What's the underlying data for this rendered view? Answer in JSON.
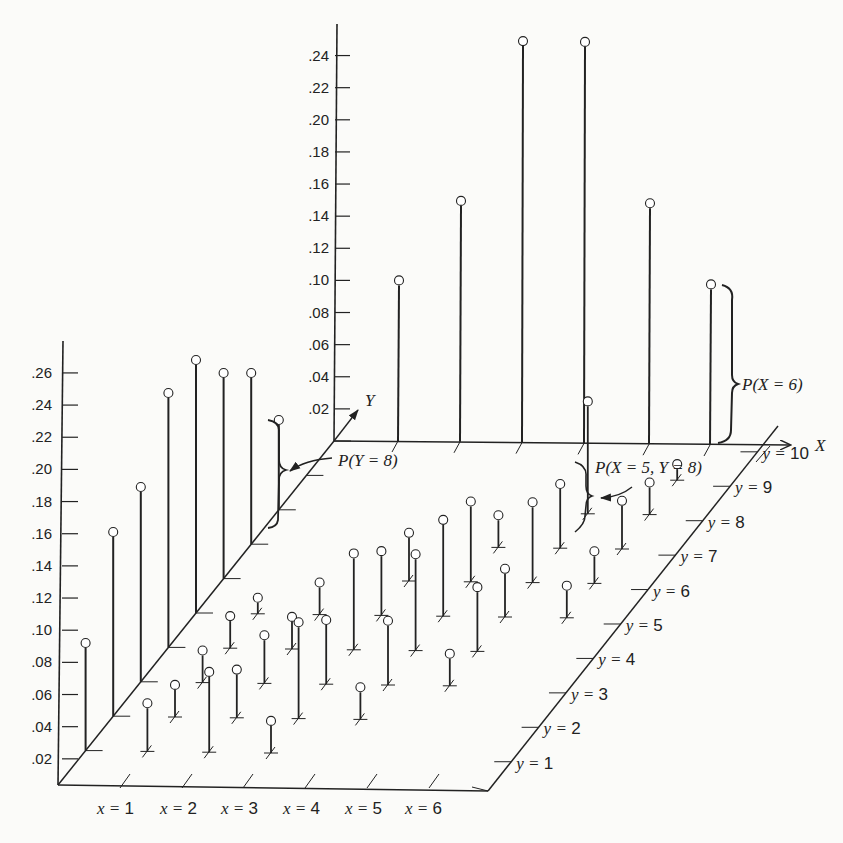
{
  "chart_data": {
    "type": "3d-stem",
    "title": "",
    "x_values": [
      1,
      2,
      3,
      4,
      5,
      6
    ],
    "y_values": [
      1,
      2,
      3,
      4,
      5,
      6,
      7,
      8,
      9,
      10
    ],
    "x_axis_label": "X",
    "y_axis_label": "Y",
    "x_tick_labels": [
      "x = 1",
      "x = 2",
      "x = 3",
      "x = 4",
      "x = 5",
      "x = 6"
    ],
    "y_tick_labels": [
      "y = 1",
      "y = 2",
      "y = 3",
      "y = 4",
      "y = 5",
      "y = 6",
      "y = 7",
      "y = 8",
      "y = 9",
      "y = 10"
    ],
    "marginal_x": {
      "axis_ticks": [
        ".02",
        ".04",
        ".06",
        ".08",
        ".10",
        ".12",
        ".14",
        ".16",
        ".18",
        ".20",
        ".22",
        ".24"
      ],
      "categories": [
        1,
        2,
        3,
        4,
        5,
        6
      ],
      "values": [
        0.1,
        0.15,
        0.25,
        0.25,
        0.15,
        0.1
      ]
    },
    "marginal_y": {
      "axis_ticks": [
        ".02",
        ".04",
        ".06",
        ".08",
        ".10",
        ".12",
        ".14",
        ".16",
        ".18",
        ".20",
        ".22",
        ".24",
        ".26"
      ],
      "categories": [
        1,
        2,
        3,
        4,
        5,
        6,
        7,
        8,
        9,
        10
      ],
      "values": [
        0.08,
        0.12,
        0.14,
        0.17,
        0.17,
        0.14,
        0.12,
        0.07,
        0,
        0
      ]
    },
    "joint_stems": [
      {
        "x": 1,
        "y": 1,
        "p": 0.03
      },
      {
        "x": 1,
        "y": 2,
        "p": 0.02
      },
      {
        "x": 1,
        "y": 3,
        "p": 0.02
      },
      {
        "x": 1,
        "y": 4,
        "p": 0.02
      },
      {
        "x": 1,
        "y": 5,
        "p": 0.01
      },
      {
        "x": 2,
        "y": 1,
        "p": 0.05
      },
      {
        "x": 2,
        "y": 2,
        "p": 0.03
      },
      {
        "x": 2,
        "y": 3,
        "p": 0.03
      },
      {
        "x": 2,
        "y": 4,
        "p": 0.02
      },
      {
        "x": 2,
        "y": 5,
        "p": 0.02
      },
      {
        "x": 3,
        "y": 1,
        "p": 0.02
      },
      {
        "x": 3,
        "y": 2,
        "p": 0.06
      },
      {
        "x": 3,
        "y": 3,
        "p": 0.04
      },
      {
        "x": 3,
        "y": 4,
        "p": 0.06
      },
      {
        "x": 3,
        "y": 5,
        "p": 0.04
      },
      {
        "x": 3,
        "y": 6,
        "p": 0.03
      },
      {
        "x": 4,
        "y": 2,
        "p": 0.02
      },
      {
        "x": 4,
        "y": 3,
        "p": 0.04
      },
      {
        "x": 4,
        "y": 4,
        "p": 0.06
      },
      {
        "x": 4,
        "y": 5,
        "p": 0.06
      },
      {
        "x": 4,
        "y": 6,
        "p": 0.05
      },
      {
        "x": 4,
        "y": 7,
        "p": 0.02
      },
      {
        "x": 5,
        "y": 3,
        "p": 0.02
      },
      {
        "x": 5,
        "y": 4,
        "p": 0.04
      },
      {
        "x": 5,
        "y": 5,
        "p": 0.03
      },
      {
        "x": 5,
        "y": 6,
        "p": 0.05
      },
      {
        "x": 5,
        "y": 7,
        "p": 0.04
      },
      {
        "x": 5,
        "y": 8,
        "p": 0.07
      },
      {
        "x": 6,
        "y": 5,
        "p": 0.02
      },
      {
        "x": 6,
        "y": 6,
        "p": 0.02
      },
      {
        "x": 6,
        "y": 7,
        "p": 0.03
      },
      {
        "x": 6,
        "y": 8,
        "p": 0.02
      },
      {
        "x": 6,
        "y": 9,
        "p": 0.01
      }
    ],
    "annotations": [
      "P(X = 6)",
      "P(Y = 8)",
      "P(X = 5, Y = 8)"
    ],
    "grid": false,
    "legend": null
  },
  "labels": {
    "x_axis": "X",
    "y_axis": "Y",
    "annot_px6": "P(X = 6)",
    "annot_py8": "P(Y = 8)",
    "annot_pxy": "P(X = 5, Y = 8)"
  }
}
